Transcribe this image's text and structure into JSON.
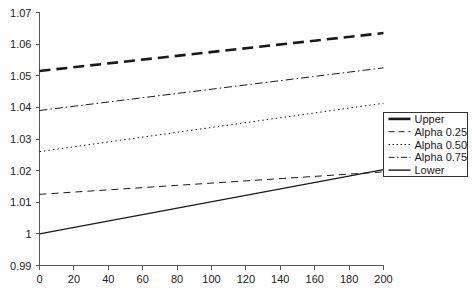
{
  "chart_data": {
    "type": "line",
    "title": "",
    "xlabel": "",
    "ylabel": "",
    "xlim": [
      0,
      200
    ],
    "ylim": [
      0.99,
      1.07
    ],
    "grid": false,
    "legend_position": "right",
    "x_ticks": [
      0,
      20,
      40,
      60,
      80,
      100,
      120,
      140,
      160,
      180,
      200
    ],
    "x_tick_labels": [
      "0",
      "20",
      "40",
      "60",
      "80",
      "100",
      "120",
      "140",
      "160",
      "180",
      "200"
    ],
    "y_ticks": [
      0.99,
      1.0,
      1.01,
      1.02,
      1.03,
      1.04,
      1.05,
      1.06,
      1.07
    ],
    "y_tick_labels": [
      "0.99",
      "1",
      "1.01",
      "1.02",
      "1.03",
      "1.04",
      "1.05",
      "1.06",
      "1.07"
    ],
    "x": [
      0,
      200
    ],
    "series": [
      {
        "name": "Upper",
        "style": "thick-dashed",
        "color": "#1a1a1a",
        "width": 2.6,
        "dash": "11,6",
        "values": [
          1.0515,
          1.0635
        ]
      },
      {
        "name": "Alpha 0.25",
        "style": "dashed",
        "color": "#1a1a1a",
        "width": 1.0,
        "dash": "7,5",
        "values": [
          1.0125,
          1.0196
        ]
      },
      {
        "name": "Alpha 0.50",
        "style": "dotted",
        "color": "#1a1a1a",
        "width": 1.0,
        "dash": "1.5,3",
        "values": [
          1.026,
          1.0413
        ]
      },
      {
        "name": "Alpha 0.75",
        "style": "dash-dot",
        "color": "#1a1a1a",
        "width": 1.0,
        "dash": "8,3,1.5,3",
        "values": [
          1.039,
          1.0525
        ]
      },
      {
        "name": "Lower",
        "style": "solid",
        "color": "#1a1a1a",
        "width": 1.4,
        "dash": "none",
        "values": [
          1.0,
          1.0203
        ]
      }
    ],
    "legend_entries": [
      {
        "label": "Upper",
        "dash": "none",
        "width": 2.6
      },
      {
        "label": "Alpha 0.25",
        "dash": "6,4",
        "width": 1.0
      },
      {
        "label": "Alpha 0.50",
        "dash": "1.5,2.5",
        "width": 1.0
      },
      {
        "label": "Alpha 0.75",
        "dash": "6,2.5,1.5,2.5",
        "width": 1.0
      },
      {
        "label": "Lower",
        "dash": "none",
        "width": 1.4
      }
    ]
  },
  "axes": {
    "x_axis_name": "x-axis",
    "y_axis_name": "y-axis"
  },
  "colors": {
    "ink": "#1a1a1a",
    "axis": "#555555",
    "background": "#ffffff"
  }
}
